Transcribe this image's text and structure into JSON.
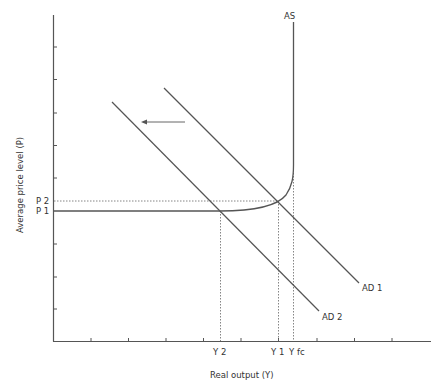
{
  "diagram": {
    "type": "economics-ad-as",
    "axes": {
      "x_label": "Real output (Y)",
      "y_label": "Average price level (P)"
    },
    "price_labels": {
      "p2": "P 2",
      "p1": "P 1"
    },
    "output_labels": {
      "y2": "Y 2",
      "y1": "Y 1",
      "yfc": "Y fc"
    },
    "curves": {
      "as": "AS",
      "ad1": "AD 1",
      "ad2": "AD 2"
    },
    "shift_arrow": {
      "direction": "left",
      "meaning": "AD 1 shifts to AD 2"
    },
    "colors": {
      "line": "#555555",
      "text": "#333333",
      "background": "#ffffff"
    }
  }
}
